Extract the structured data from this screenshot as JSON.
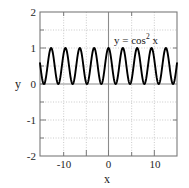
{
  "chart_data": {
    "type": "line",
    "title": "",
    "subtitle": "",
    "xlabel": "x",
    "ylabel": "y",
    "xlim": [
      -15,
      15
    ],
    "ylim": [
      -2,
      2
    ],
    "grid": true,
    "grid_style": "dotted",
    "legend": "none",
    "annotations": [
      {
        "text_plain": "y = cos2 x",
        "text_lhs": "y = cos",
        "text_exponent": "2",
        "text_rhs": " x",
        "x": 6.5,
        "y": 1.45
      }
    ],
    "xticks": [
      -10,
      0,
      10
    ],
    "xticklabels": [
      "-10",
      "0",
      "10"
    ],
    "xticks_minor": [
      -15,
      -5,
      5,
      15
    ],
    "yticks": [
      -2,
      -1,
      0,
      1,
      2
    ],
    "yticklabels": [
      "-2",
      "-1",
      "0",
      "1",
      "2"
    ],
    "yticks_minor": [
      -1.5,
      -0.5,
      0.5,
      1.5
    ],
    "series": [
      {
        "name": "y = cos^2 x",
        "function": "cos(x)^2",
        "color": "#000000",
        "line_width": 1.9,
        "amplitude_min": 0,
        "amplitude_max": 1,
        "period": 3.14159,
        "num_visible_periods": 10,
        "x": [
          -15,
          -14.5,
          -14,
          -13.5,
          -13,
          -12.5,
          -12,
          -11.5,
          -11,
          -10.5,
          -10,
          -9.5,
          -9,
          -8.5,
          -8,
          -7.5,
          -7,
          -6.5,
          -6,
          -5.5,
          -5,
          -4.5,
          -4,
          -3.5,
          -3,
          -2.5,
          -2,
          -1.5,
          -1,
          -0.5,
          0,
          0.5,
          1,
          1.5,
          2,
          2.5,
          3,
          3.5,
          4,
          4.5,
          5,
          5.5,
          6,
          6.5,
          7,
          7.5,
          8,
          8.5,
          9,
          9.5,
          10,
          10.5,
          11,
          11.5,
          12,
          12.5,
          13,
          13.5,
          14,
          14.5,
          15
        ],
        "y": [
          0.58,
          0.9,
          0.99,
          0.81,
          0.43,
          0.1,
          0.0,
          0.17,
          0.0045,
          0.75,
          0.7,
          0.96,
          0.83,
          0.34,
          0.02,
          0.11,
          0.57,
          0.9,
          0.92,
          0.51,
          0.08,
          0.04,
          0.43,
          0.88,
          0.98,
          0.64,
          0.17,
          0.005,
          0.29,
          0.77,
          1.0,
          0.77,
          0.29,
          0.005,
          0.17,
          0.64,
          0.98,
          0.88,
          0.43,
          0.04,
          0.08,
          0.51,
          0.92,
          0.9,
          0.57,
          0.11,
          0.02,
          0.34,
          0.83,
          0.96,
          0.7,
          0.75,
          0.0045,
          0.17,
          0.0,
          0.1,
          0.43,
          0.81,
          0.99,
          0.9,
          0.58
        ]
      }
    ],
    "axis_lines": {
      "x_zero_line": 0,
      "y_zero_line": 0,
      "color": "#8c8c8c"
    },
    "colors": {
      "curve": "#000000",
      "frame": "#7a7a7a",
      "grid": "#b8b8b8",
      "axis_line": "#8c8c8c",
      "background": "#ffffff",
      "text": "#1a1a1a"
    }
  }
}
